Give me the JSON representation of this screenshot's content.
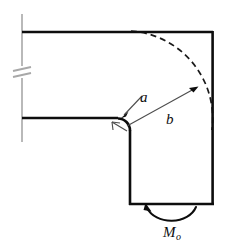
{
  "figure": {
    "type": "engineering-mechanics-diagram",
    "background_color": "#ffffff",
    "outline_color": "#0d0d0d",
    "support_color": "#a8a8a8",
    "dimension_color": "#4d4d4d",
    "dashed_color": "#1a1a1a"
  },
  "labels": {
    "radius_inner": "a",
    "radius_outer": "b",
    "moment": "M",
    "moment_subscript": "o"
  },
  "geometry": {
    "wall_x": 22,
    "top_flange_y": 32,
    "inner_flange_y": 118,
    "right_edge_x": 213,
    "bottom_edge_y": 205,
    "arm_left_x": 130,
    "fillet_radius": 12,
    "corner_center_x": 130,
    "corner_center_y": 118,
    "arc_radius_outer": 88,
    "break_symbol_y": 72
  },
  "annotations": {
    "leader_a_from": "140,92",
    "leader_a_to": "122,116",
    "dimension_b_from": "126,124",
    "dimension_b_to": "196,88",
    "moment_arc_center": "172,207"
  }
}
